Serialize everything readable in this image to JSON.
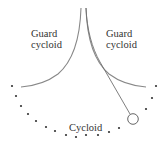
{
  "diagram": {
    "labels": {
      "left_guard_line1": "Guard",
      "left_guard_line2": "cycloid",
      "right_guard_line1": "Guard",
      "right_guard_line2": "cycloid",
      "cycloid": "Cycloid"
    },
    "colors": {
      "curve": "#808080",
      "dots": "#333333",
      "text": "#333333",
      "string": "#707070",
      "bob": "#555555"
    }
  }
}
